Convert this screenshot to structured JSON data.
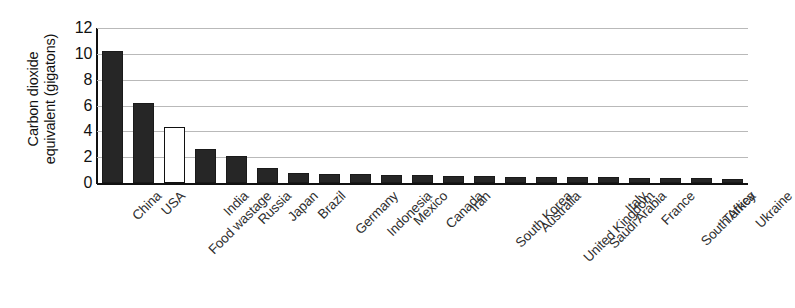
{
  "chart_data": {
    "type": "bar",
    "title": "",
    "xlabel": "",
    "ylabel": "Carbon dioxide equivalent (gigatons)",
    "ylabel_line1": "Carbon dioxide",
    "ylabel_line2": "equivalent (gigatons)",
    "ylim": [
      0,
      12
    ],
    "yticks": [
      12,
      10,
      8,
      6,
      4,
      2,
      0
    ],
    "ytick_labels": [
      "12",
      "10",
      "8",
      "6",
      "4",
      "2",
      "0"
    ],
    "grid": true,
    "grid_axis": "y",
    "legend": "none",
    "categories": [
      "China",
      "USA",
      "Food wastage",
      "India",
      "Russia",
      "Japan",
      "Brazil",
      "Germany",
      "Indonesia",
      "Mexico",
      "Canada",
      "Iran",
      "South Korea",
      "Australia",
      "United Kingdom",
      "Saudi Arabia",
      "Italy",
      "France",
      "South Africa",
      "Turkey",
      "Ukraine"
    ],
    "values": [
      10.2,
      6.2,
      4.3,
      2.6,
      2.1,
      1.2,
      0.75,
      0.72,
      0.68,
      0.65,
      0.62,
      0.58,
      0.55,
      0.5,
      0.48,
      0.45,
      0.43,
      0.4,
      0.38,
      0.35,
      0.33
    ],
    "bar_styles": [
      "filled",
      "filled",
      "hollow",
      "filled",
      "filled",
      "filled",
      "filled",
      "filled",
      "filled",
      "filled",
      "filled",
      "filled",
      "filled",
      "filled",
      "filled",
      "filled",
      "filled",
      "filled",
      "filled",
      "filled",
      "filled"
    ],
    "colors": {
      "bar_fill": "#262626",
      "bar_highlight_fill": "#ffffff",
      "bar_stroke": "#1a1a1a",
      "gridline": "#b9b9b9",
      "axis": "#111111",
      "text": "#2e2e2e",
      "background": "#ffffff"
    }
  }
}
